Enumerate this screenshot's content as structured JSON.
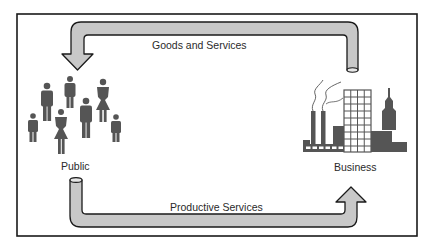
{
  "diagram": {
    "nodes": {
      "public": {
        "label": "Public",
        "icon": "people-group-icon"
      },
      "business": {
        "label": "Business",
        "icon": "factory-city-icon"
      }
    },
    "flows": {
      "top": {
        "label": "Goods and Services",
        "from": "Business",
        "to": "Public"
      },
      "bottom": {
        "label": "Productive Services",
        "from": "Public",
        "to": "Business"
      }
    },
    "colors": {
      "frame": "#1a1a1a",
      "arrow_fill": "#c8c8c8",
      "arrow_stroke": "#1a1a1a",
      "figure_fill": "#555555",
      "text": "#2a2a2a"
    }
  }
}
